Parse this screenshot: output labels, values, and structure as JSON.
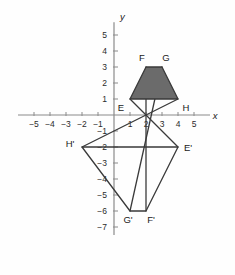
{
  "figure": {
    "axis": {
      "x_label": "x",
      "y_label": "y",
      "x_ticks": [
        "-5",
        "-4",
        "-3",
        "-2",
        "-1",
        "1",
        "2",
        "3",
        "4",
        "5"
      ],
      "y_ticks": [
        "5",
        "4",
        "3",
        "2",
        "1",
        "-1",
        "-2",
        "-3",
        "-4",
        "-5",
        "-6",
        "-7"
      ],
      "x_range": [
        -6,
        6
      ],
      "y_range": [
        -7.5,
        5.8
      ],
      "origin_px": [
        114,
        115
      ],
      "unit_px": 16
    },
    "colors": {
      "axis": "#8a8a8a",
      "stroke": "#3a3a3a",
      "fill_preimage": "#6b6b6b",
      "fill_image": "none",
      "text": "#1a1a1a"
    },
    "shapes": [
      {
        "name": "preimage-trapezoid",
        "label_set": [
          "E",
          "F",
          "G",
          "H"
        ],
        "filled": true,
        "vertices": [
          {
            "label": "E",
            "x": 1,
            "y": 1,
            "label_dx": -9,
            "label_dy": 12
          },
          {
            "label": "F",
            "x": 2,
            "y": 3,
            "label_dx": -4,
            "label_dy": -6
          },
          {
            "label": "G",
            "x": 3,
            "y": 3,
            "label_dx": 4,
            "label_dy": -6
          },
          {
            "label": "H",
            "x": 4,
            "y": 1,
            "label_dx": 8,
            "label_dy": 12
          }
        ]
      },
      {
        "name": "image-trapezoid",
        "label_set": [
          "E'",
          "F'",
          "G'",
          "H'"
        ],
        "filled": false,
        "vertices": [
          {
            "label": "E'",
            "x": 4,
            "y": -2,
            "label_dx": 10,
            "label_dy": 4
          },
          {
            "label": "F'",
            "x": 2,
            "y": -6,
            "label_dx": 5,
            "label_dy": 12
          },
          {
            "label": "G'",
            "x": 1,
            "y": -6,
            "label_dx": -2,
            "label_dy": 12
          },
          {
            "label": "H'",
            "x": -2,
            "y": -2,
            "label_dx": -12,
            "label_dy": 0
          }
        ]
      }
    ],
    "dilation": {
      "center": {
        "x": 2,
        "y": 0
      },
      "rays": [
        {
          "name": "ray-E-to-Eprime",
          "from": [
            1,
            1
          ],
          "to": [
            4,
            -2
          ]
        },
        {
          "name": "ray-F-to-Fprime",
          "from": [
            2,
            3
          ],
          "to": [
            2,
            -6
          ]
        },
        {
          "name": "ray-G-to-Gprime",
          "from": [
            3,
            3
          ],
          "to": [
            1,
            -6
          ]
        },
        {
          "name": "ray-H-to-Hprime",
          "from": [
            4,
            1
          ],
          "to": [
            -2,
            -2
          ]
        }
      ]
    }
  }
}
